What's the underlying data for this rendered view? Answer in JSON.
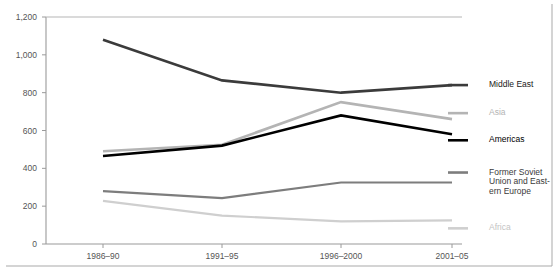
{
  "chart_data": {
    "type": "line",
    "title": "",
    "subtitle": "",
    "xlabel": "",
    "ylabel": "",
    "categories": [
      "1986–90",
      "1991–95",
      "1996–2000",
      "2001–05"
    ],
    "ylim": [
      0,
      1200
    ],
    "yticks": [
      0,
      200,
      400,
      600,
      800,
      1000,
      1200
    ],
    "ytick_labels": [
      "0",
      "200",
      "400",
      "600",
      "800",
      "1,000",
      "1,200"
    ],
    "grid": false,
    "legend_position": "right-inline",
    "series": [
      {
        "name": "Middle East",
        "color": "#3b3b3b",
        "label_color": "#1a1a1a",
        "width": 2.6,
        "values": [
          1080,
          865,
          800,
          840
        ]
      },
      {
        "name": "Asia",
        "color": "#b4b4b4",
        "label_color": "#b4b4b4",
        "width": 2.6,
        "values": [
          490,
          525,
          750,
          660
        ]
      },
      {
        "name": "Americas",
        "color": "#000000",
        "label_color": "#000000",
        "width": 2.6,
        "values": [
          465,
          520,
          680,
          580
        ]
      },
      {
        "name": "Former Soviet Union and East-ern Europe",
        "color": "#7d7d7d",
        "label_color": "#3a3a3a",
        "width": 2.2,
        "values": [
          280,
          243,
          325,
          325
        ]
      },
      {
        "name": "Africa",
        "color": "#cfcfcf",
        "label_color": "#c4c4c4",
        "width": 2.2,
        "values": [
          228,
          150,
          120,
          125
        ]
      }
    ],
    "legend_entries": [
      {
        "name": "Middle East",
        "lines": [
          "Middle East"
        ],
        "color": "#3b3b3b",
        "label_color": "#1a1a1a"
      },
      {
        "name": "Asia",
        "lines": [
          "Asia"
        ],
        "color": "#b4b4b4",
        "label_color": "#b4b4b4"
      },
      {
        "name": "Americas",
        "lines": [
          "Americas"
        ],
        "color": "#000000",
        "label_color": "#000000"
      },
      {
        "name": "Former Soviet Union and Eastern Europe",
        "lines": [
          "Former Soviet",
          "Union and East-",
          "ern Europe"
        ],
        "color": "#7d7d7d",
        "label_color": "#3a3a3a"
      },
      {
        "name": "Africa",
        "lines": [
          "Africa"
        ],
        "color": "#cfcfcf",
        "label_color": "#c4c4c4"
      }
    ]
  },
  "axis": {
    "axis_color": "#9a9a9a",
    "baseline_color": "#9a9a9a",
    "topline_color": "#b5b5b5",
    "tick_color": "#9a9a9a",
    "frame_color": "#a9a9a9"
  }
}
